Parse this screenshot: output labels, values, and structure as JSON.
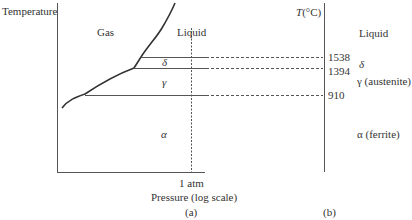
{
  "diagram_a": {
    "y_axis_label": "Temperature",
    "x_axis_label": "Pressure (log scale)",
    "x_tick_label": "1 atm",
    "caption": "(a)",
    "regions": {
      "gas": "Gas",
      "liquid": "Liquid",
      "delta": "δ",
      "gamma": "γ",
      "alpha": "α"
    }
  },
  "diagram_b": {
    "axis_label_T": "T",
    "axis_label_unit": "(°C)",
    "caption": "(b)",
    "temperatures": [
      {
        "value": "1538"
      },
      {
        "value": "1394"
      },
      {
        "value": "910"
      }
    ],
    "phases": {
      "liquid": "Liquid",
      "delta": "δ",
      "gamma": "γ (austenite)",
      "alpha": "α (ferrite)"
    }
  },
  "colors": {
    "line": "#3a3a3a",
    "text": "#333333"
  }
}
